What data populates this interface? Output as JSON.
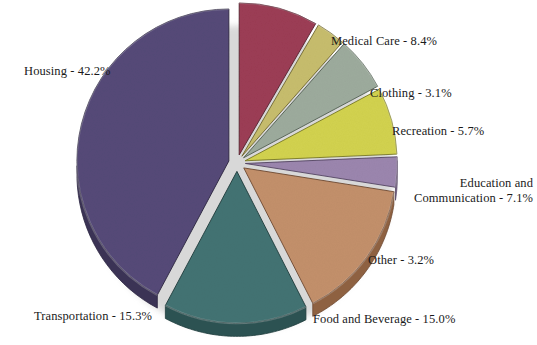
{
  "chart_data": {
    "type": "pie",
    "title": "",
    "subtitle": "",
    "xlabel": "",
    "ylabel": "",
    "legend_position": "outside-labels",
    "grid": false,
    "total_percent": 100.0,
    "start_angle_deg": -90,
    "direction": "clockwise",
    "exploded": true,
    "style": "3d",
    "categories": [
      "Medical Care",
      "Clothing",
      "Recreation",
      "Education and Communication",
      "Other",
      "Food and Beverage",
      "Transportation",
      "Housing"
    ],
    "values": [
      8.4,
      3.1,
      5.7,
      7.1,
      3.2,
      15.0,
      15.3,
      42.2
    ],
    "slices": [
      {
        "key": "medical-care",
        "name": "Medical Care",
        "value": 8.4,
        "label": "Medical Care - 8.4%",
        "color": "#9c3d55",
        "side_color": "#6f2a3c",
        "edge_color": "#55202e",
        "label_x": 331,
        "label_y": 34,
        "align": "left",
        "explode": 0.055,
        "lines": [
          "Medical Care - 8.4%"
        ]
      },
      {
        "key": "clothing",
        "name": "Clothing",
        "value": 3.1,
        "label": "Clothing - 3.1%",
        "color": "#c7bd6d",
        "side_color": "#93893f",
        "edge_color": "#6f672e",
        "label_x": 370,
        "label_y": 86,
        "align": "left",
        "explode": 0.055,
        "lines": [
          "Clothing - 3.1%"
        ]
      },
      {
        "key": "recreation",
        "name": "Recreation",
        "value": 5.7,
        "label": "Recreation - 5.7%",
        "color": "#9dab9d",
        "side_color": "#6d7b6d",
        "edge_color": "#515f51",
        "label_x": 392,
        "label_y": 124,
        "align": "left",
        "explode": 0.055,
        "lines": [
          "Recreation - 5.7%"
        ]
      },
      {
        "key": "education-and-communication",
        "name": "Education and Communication",
        "value": 7.1,
        "label": "Education and Communication - 7.1%",
        "color": "#d2d24f",
        "side_color": "#9d9d33",
        "edge_color": "#787823",
        "label_x": 533,
        "label_y": 176,
        "align": "right",
        "explode": 0.055,
        "lines": [
          "Education and",
          "Communication - 7.1%"
        ]
      },
      {
        "key": "other",
        "name": "Other",
        "value": 3.2,
        "label": "Other - 3.2%",
        "color": "#9b86ae",
        "side_color": "#6f5c81",
        "edge_color": "#554563",
        "label_x": 368,
        "label_y": 253,
        "align": "left",
        "explode": 0.055,
        "lines": [
          "Other - 3.2%"
        ]
      },
      {
        "key": "food-and-beverage",
        "name": "Food and Beverage",
        "value": 15.0,
        "label": "Food and Beverage - 15.0%",
        "color": "#c3906b",
        "side_color": "#8e6141",
        "edge_color": "#6d4830",
        "label_x": 313,
        "label_y": 312,
        "align": "left",
        "explode": 0.055,
        "lines": [
          "Food and Beverage - 15.0%"
        ]
      },
      {
        "key": "transportation",
        "name": "Transportation",
        "value": 15.3,
        "label": "Transportation - 15.3%",
        "color": "#437373",
        "side_color": "#2c5252",
        "edge_color": "#1e3c3c",
        "label_x": 34,
        "label_y": 309,
        "align": "left",
        "explode": 0.055,
        "lines": [
          "Transportation - 15.3%"
        ]
      },
      {
        "key": "housing",
        "name": "Housing",
        "value": 42.2,
        "label": "Housing - 42.2%",
        "color": "#554a78",
        "side_color": "#3b3355",
        "edge_color": "#2b2540",
        "label_x": 24,
        "label_y": 64,
        "align": "left",
        "explode": 0.055,
        "lines": [
          "Housing - 42.2%"
        ]
      }
    ]
  },
  "geometry": {
    "cx": 237,
    "cy": 163,
    "rx": 152,
    "ry": 152,
    "depth": 13
  }
}
